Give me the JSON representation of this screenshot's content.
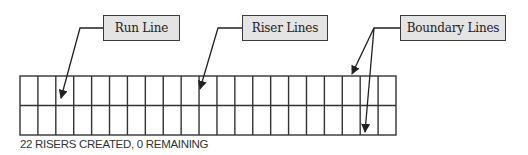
{
  "labels": {
    "run_line": "Run Line",
    "riser_lines": "Riser Lines",
    "boundary_lines": "Boundary Lines"
  },
  "status": {
    "text": "22 RISERS CREATED, 0 REMAINING",
    "risers_created": 22,
    "risers_remaining": 0
  },
  "grid": {
    "columns": 21,
    "rows": 2,
    "riser_count": 22
  },
  "colors": {
    "line": "#333333",
    "label_fill": "#e4e4e4",
    "label_border": "#3a3a3a",
    "text": "#222222"
  }
}
